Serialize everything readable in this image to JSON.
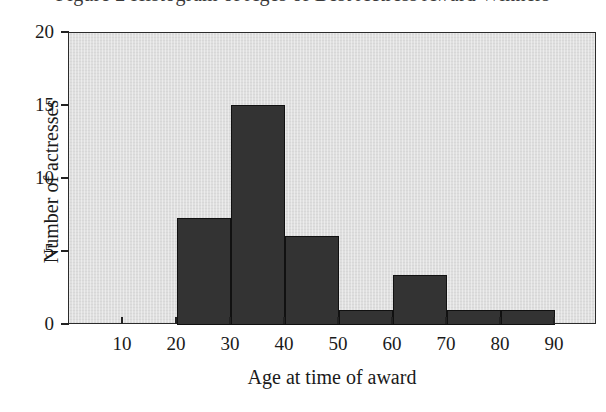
{
  "caption": {
    "text": "Figure 2  Histogram of Ages of Best Actress Award Winners"
  },
  "chart_data": {
    "type": "bar",
    "title": "",
    "xlabel": "Age at time of award",
    "ylabel": "Number of actresses",
    "categories": [
      "20-30",
      "30-40",
      "40-50",
      "50-60",
      "60-70",
      "70-80",
      "80-90"
    ],
    "bin_starts": [
      20,
      30,
      40,
      50,
      60,
      70,
      80
    ],
    "bin_width": 10,
    "values": [
      7.3,
      15.1,
      6.1,
      1.0,
      3.4,
      1.0,
      1.0
    ],
    "xlim": [
      0,
      97.8
    ],
    "ylim": [
      0,
      20
    ],
    "xticks": [
      10,
      20,
      30,
      40,
      50,
      60,
      70,
      80,
      90
    ],
    "xtick_labels": [
      "10",
      "20",
      "30",
      "40",
      "50",
      "60",
      "70",
      "80",
      "90"
    ],
    "yticks": [
      0,
      5,
      10,
      15,
      20
    ],
    "ytick_labels": [
      "0",
      "5",
      "10",
      "15",
      "20"
    ],
    "grid": false,
    "legend": false,
    "bar_color": "#333333",
    "bar_edge_color": "#111111",
    "plot_background": "#dfdfdf",
    "axis_color": "#2b2b2b"
  }
}
